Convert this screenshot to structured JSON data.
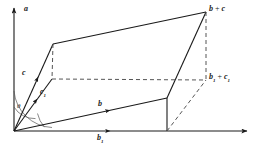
{
  "figure": {
    "background": "#ffffff",
    "stroke_color": "#1a1a1a",
    "dash_color": "#555555"
  },
  "labels": {
    "axis_vertical": "a",
    "vector_c": "c",
    "vector_c1_base": "c",
    "vector_c1_sub": "1",
    "vector_b": "b",
    "vector_b1_base": "b",
    "vector_b1_sub": "1",
    "sum_top_left": "b",
    "sum_top_plus": " + ",
    "sum_top_right": "c",
    "sum_proj_b": "b",
    "sum_proj_b_sub": "1",
    "sum_proj_plus": " + ",
    "sum_proj_c": "c",
    "sum_proj_c_sub": "1",
    "angle": "θ"
  },
  "geometry": {
    "origin": {
      "x": 14,
      "y": 131
    },
    "axis_vertical_tip": {
      "x": 14,
      "y": 5
    },
    "axis_horizontal_tip": {
      "x": 250,
      "y": 131
    },
    "point_c": {
      "x": 53,
      "y": 44
    },
    "point_c1": {
      "x": 52,
      "y": 79
    },
    "point_b": {
      "x": 167,
      "y": 98
    },
    "point_b1": {
      "x": 167,
      "y": 131
    },
    "point_b_plus_c": {
      "x": 206,
      "y": 12
    },
    "point_b1_plus_c1": {
      "x": 206,
      "y": 80
    },
    "angle_theta_degrees": 38
  }
}
